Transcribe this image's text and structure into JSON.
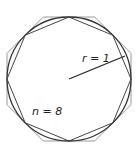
{
  "diagram": {
    "type": "polygon-approximation-of-circle",
    "labels": {
      "radius": "r = 1",
      "sides": "n = 8"
    },
    "circle": {
      "cx": 69,
      "cy": 79,
      "r": 62
    },
    "sides": 8,
    "colors": {
      "circle": "#333333",
      "inscribed": "#333333",
      "circumscribed": "#999999",
      "radius_line": "#222222"
    }
  }
}
